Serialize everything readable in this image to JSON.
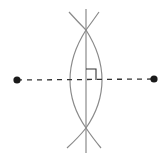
{
  "figure": {
    "title": "Perpendicular bisector construction",
    "caption_cropped": "",
    "colors": {
      "construction": "#8a8a8a",
      "segment": "#333333",
      "point": "#1a1a1a",
      "background": "#ffffff"
    },
    "points": [
      {
        "id": "A",
        "x": 17,
        "y": 80
      },
      {
        "id": "B",
        "x": 154,
        "y": 79
      }
    ],
    "segment": {
      "from": "A",
      "to": "B",
      "style": "dashed"
    },
    "bisector": {
      "x": 86,
      "y1": 9,
      "y2": 153
    },
    "arc_intersections": [
      {
        "x": 86,
        "y": 30
      },
      {
        "x": 86,
        "y": 128
      }
    ],
    "right_angle_marker": {
      "x": 86,
      "y": 80,
      "size": 10
    }
  }
}
